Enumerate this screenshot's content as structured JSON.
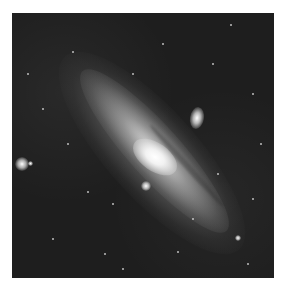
{
  "image": {
    "subject": "spiral galaxy",
    "style": "grayscale astronomical photograph",
    "background_color": "#ffffff",
    "sky_color": "#1c1c1c",
    "features": [
      {
        "name": "galactic-core",
        "x": 143,
        "y": 144
      },
      {
        "name": "companion-galaxy",
        "x": 185,
        "y": 105
      },
      {
        "name": "bright-star-left",
        "x": 21,
        "y": 163
      },
      {
        "name": "bright-star-center",
        "x": 146,
        "y": 187
      }
    ]
  }
}
